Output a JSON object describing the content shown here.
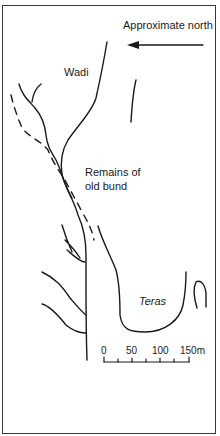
{
  "diagram": {
    "type": "sketch-map",
    "labels": {
      "north": "Approximate north",
      "wadi": "Wadi",
      "bund_line1": "Remains of",
      "bund_line2": "old bund",
      "teras": "Teras"
    },
    "scale_bar": {
      "ticks": [
        "0",
        "50",
        "100",
        "150m"
      ],
      "unit": "m",
      "max": 150
    },
    "colors": {
      "line": "#1a1a1a",
      "background": "#ffffff",
      "border": "#3a3a3a"
    }
  }
}
